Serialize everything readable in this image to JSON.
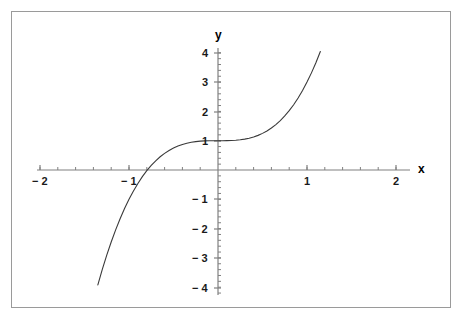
{
  "figure": {
    "background_color": "#ffffff",
    "frame_color": "#9a9a9a",
    "axis_color": "#808080",
    "curve_color": "#3a3a3a",
    "label_color": "#1a1a1a"
  },
  "axes": {
    "x_axis_label": "x",
    "y_axis_label": "y",
    "x_ticks": [
      {
        "value": -2,
        "label": "− 2",
        "px": 40
      },
      {
        "value": -1,
        "label": "− 1",
        "px": 129
      },
      {
        "value": 1,
        "label": "1",
        "px": 307
      },
      {
        "value": 2,
        "label": "2",
        "px": 396
      }
    ],
    "y_ticks": [
      {
        "value": 4,
        "label": "4",
        "px": 53
      },
      {
        "value": 3,
        "label": "3",
        "px": 82
      },
      {
        "value": 2,
        "label": "2",
        "px": 112
      },
      {
        "value": 1,
        "label": "1",
        "px": 141
      },
      {
        "value": -1,
        "label": "− 1",
        "px": 199
      },
      {
        "value": -2,
        "label": "− 2",
        "px": 229
      },
      {
        "value": -3,
        "label": "− 3",
        "px": 258
      },
      {
        "value": -4,
        "label": "− 4",
        "px": 288
      }
    ],
    "origin_px": {
      "x": 218,
      "y": 170
    },
    "x_scale_px_per_unit": 89,
    "y_scale_px_per_unit": 29.3,
    "minor_tick_step": 0.2
  },
  "chart_data": {
    "type": "line",
    "title": "",
    "xlabel": "x",
    "ylabel": "y",
    "xlim": [
      -2.3,
      2.4
    ],
    "ylim": [
      -4.4,
      4.4
    ],
    "grid": false,
    "legend": null,
    "series": [
      {
        "name": "y = 2x^3 + 1",
        "expression": "2*x**3 + 1",
        "x": [
          -1.45,
          -1.4,
          -1.35,
          -1.3,
          -1.25,
          -1.2,
          -1.15,
          -1.1,
          -1.05,
          -1.0,
          -0.95,
          -0.9,
          -0.85,
          -0.8,
          -0.75,
          -0.7,
          -0.65,
          -0.6,
          -0.55,
          -0.5,
          -0.45,
          -0.4,
          -0.35,
          -0.3,
          -0.25,
          -0.2,
          -0.15,
          -0.1,
          -0.05,
          0.0,
          0.05,
          0.1,
          0.15,
          0.2,
          0.25,
          0.3,
          0.35,
          0.4,
          0.45,
          0.5,
          0.55,
          0.6,
          0.65,
          0.7,
          0.75,
          0.8,
          0.85,
          0.9,
          0.95,
          1.0,
          1.05,
          1.1,
          1.15,
          1.2,
          1.25
        ],
        "y": [
          -5.096,
          -4.488,
          -3.92,
          -3.394,
          -2.906,
          -2.456,
          -2.042,
          -1.662,
          -1.315,
          -1.0,
          -0.715,
          -0.458,
          -0.228,
          -0.024,
          0.156,
          0.314,
          0.451,
          0.568,
          0.667,
          0.75,
          0.818,
          0.872,
          0.914,
          0.946,
          0.969,
          0.984,
          0.993,
          0.998,
          1.0,
          1.0,
          1.0,
          1.002,
          1.007,
          1.016,
          1.031,
          1.054,
          1.086,
          1.128,
          1.182,
          1.25,
          1.333,
          1.432,
          1.549,
          1.686,
          1.844,
          2.024,
          2.228,
          2.458,
          2.715,
          3.0,
          3.315,
          3.662,
          4.042,
          4.456,
          4.906
        ]
      }
    ]
  }
}
